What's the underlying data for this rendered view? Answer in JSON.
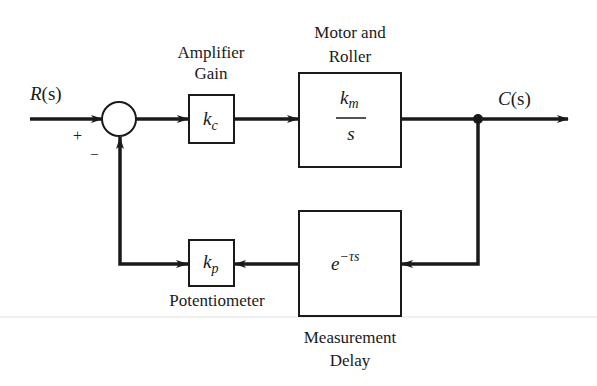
{
  "diagram": {
    "type": "control-system-block-diagram",
    "input": {
      "label": "R(s)",
      "label_main": "R",
      "label_arg": "(s)"
    },
    "output": {
      "label": "C(s)",
      "label_main": "C",
      "label_arg": "(s)"
    },
    "summing_junction": {
      "plus_sign": "+",
      "minus_sign": "–"
    },
    "blocks": [
      {
        "id": "amplifier",
        "caption_line1": "Amplifier",
        "caption_line2": "Gain",
        "tf_main": "k",
        "tf_sub": "c"
      },
      {
        "id": "motor",
        "caption_line1": "Motor and",
        "caption_line2": "Roller",
        "tf_num_main": "k",
        "tf_num_sub": "m",
        "tf_den": "s"
      },
      {
        "id": "delay",
        "caption_line1": "Measurement",
        "caption_line2": "Delay",
        "tf_base": "e",
        "tf_exp": "−τs"
      },
      {
        "id": "potentiometer",
        "caption_line1": "Potentiometer",
        "tf_main": "k",
        "tf_sub": "p"
      }
    ],
    "colors": {
      "line": "#1a1a1a",
      "background": "#ffffff",
      "rule": "#dcdcdc"
    }
  }
}
